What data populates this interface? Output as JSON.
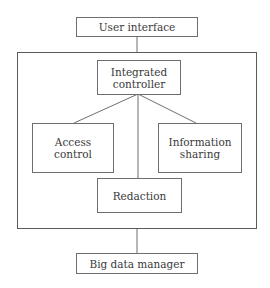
{
  "diagram": {
    "nodes": {
      "user_interface": "User interface",
      "integrated_controller": "Integrated controller",
      "access_control": "Access control",
      "information_sharing": "Information sharing",
      "redaction": "Redaction",
      "big_data_manager": "Big data manager"
    },
    "edges": [
      [
        "User interface",
        "Integrated controller group"
      ],
      [
        "Integrated controller",
        "Access control"
      ],
      [
        "Integrated controller",
        "Information sharing"
      ],
      [
        "Integrated controller",
        "Redaction"
      ],
      [
        "Integrated controller group",
        "Big data manager"
      ]
    ],
    "colors": {
      "line": "#6e6e6e",
      "text": "#3a3a3a"
    }
  }
}
